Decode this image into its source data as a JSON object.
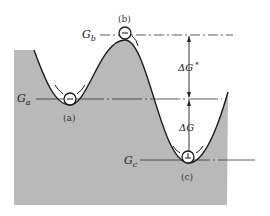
{
  "diagram": {
    "type": "free-energy landscape",
    "labels": {
      "G_a": "G",
      "G_a_sub": "a",
      "G_b": "G",
      "G_b_sub": "b",
      "G_c": "G",
      "G_c_sub": "c",
      "delta_G_activation": "ΔG",
      "delta_G_activation_sup": "*",
      "delta_G": "ΔG"
    },
    "states": [
      {
        "id": "a",
        "caption": "(a)",
        "description": "metastable state"
      },
      {
        "id": "b",
        "caption": "(b)",
        "description": "activated state"
      },
      {
        "id": "c",
        "caption": "(c)",
        "description": "stable state"
      }
    ],
    "colors": {
      "fill": "#b9b9b9",
      "line": "#1a1a1a",
      "background": "#ffffff"
    }
  }
}
